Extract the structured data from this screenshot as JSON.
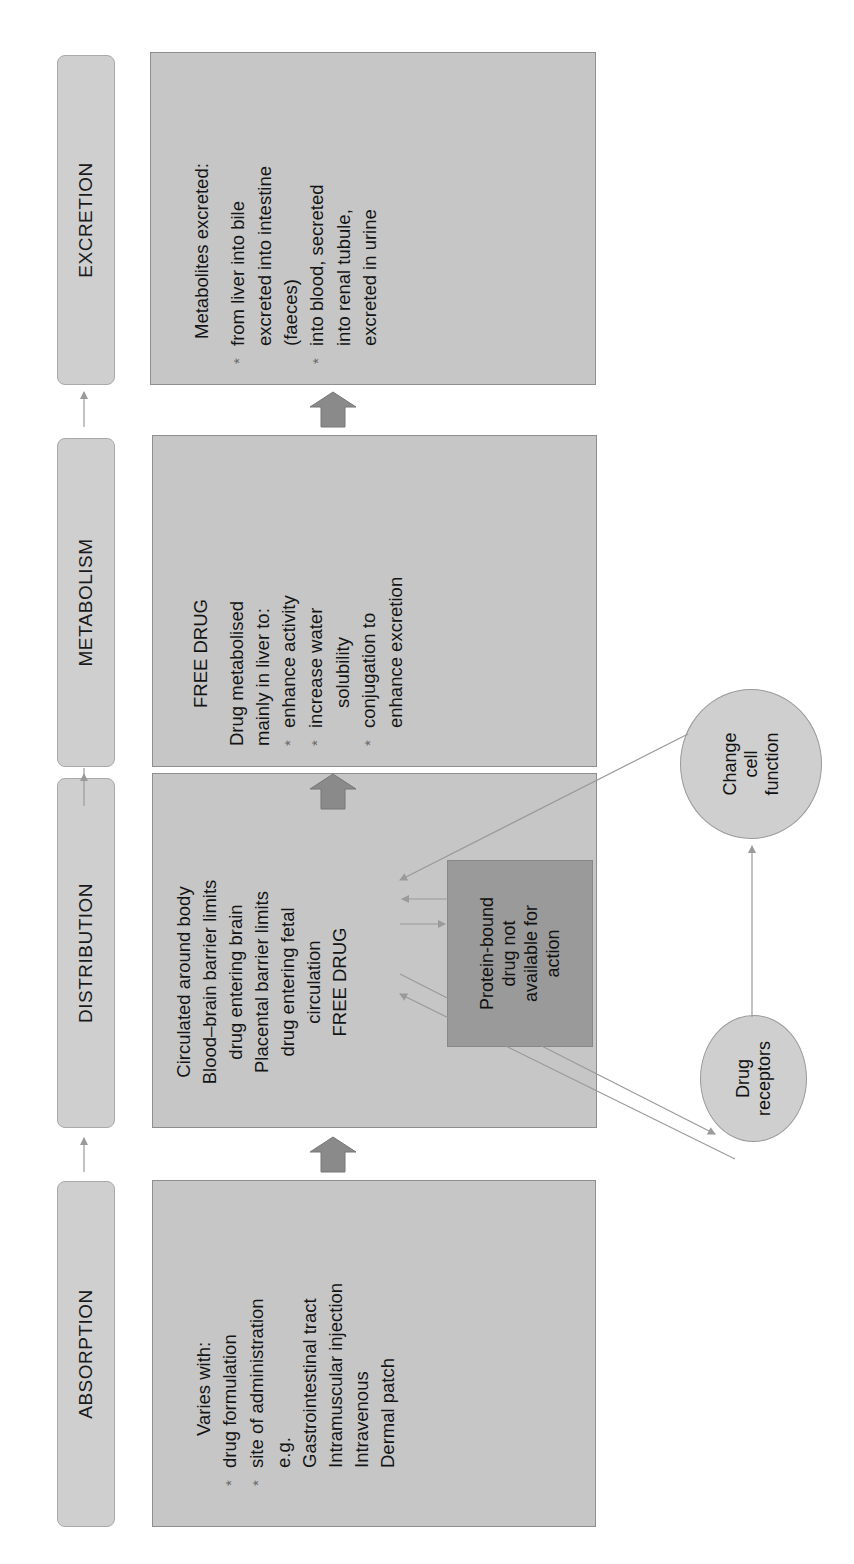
{
  "stages": [
    {
      "label": "ABSORPTION"
    },
    {
      "label": "DISTRIBUTION"
    },
    {
      "label": "METABOLISM"
    },
    {
      "label": "EXCRETION"
    }
  ],
  "absorption_box": {
    "heading": "Varies with:",
    "bullets": [
      "drug formulation",
      "site of administration"
    ],
    "example_label": "e.g.",
    "examples": [
      "Gastrointestinal tract",
      "Intramuscular injection",
      "Intravenous",
      "Dermal patch"
    ]
  },
  "distribution_box": {
    "lines": [
      "Circulated around body",
      "Blood–brain barrier limits",
      "drug entering brain",
      "Placental barrier limits",
      "drug entering fetal",
      "circulation",
      "FREE DRUG"
    ],
    "protein_bound": [
      "Protein-bound",
      "drug not",
      "available for",
      "action"
    ]
  },
  "metabolism_box": {
    "heading": "FREE DRUG",
    "intro": [
      "Drug metabolised",
      "mainly in liver to:"
    ],
    "bullets": [
      [
        "enhance activity"
      ],
      [
        "increase water",
        "solubility"
      ],
      [
        "conjugation to",
        "enhance excretion"
      ]
    ]
  },
  "excretion_box": {
    "heading": "Metabolites excreted:",
    "bullets": [
      [
        "from liver into bile",
        "excreted into intestine",
        "(faeces)"
      ],
      [
        "into blood, secreted",
        "into renal tubule,",
        "excreted in urine"
      ]
    ]
  },
  "ellipses": {
    "receptors": [
      "Drug",
      "receptors"
    ],
    "cell_function": [
      "Change",
      "cell",
      "function"
    ]
  },
  "bullet_symbol": "*",
  "colors": {
    "pill_fill": "#cfcfcf",
    "box_fill": "#c6c6c6",
    "protein_fill": "#9a9a9a",
    "arrow": "#8a8a8a",
    "thin_arrow": "#9a9a9a"
  }
}
